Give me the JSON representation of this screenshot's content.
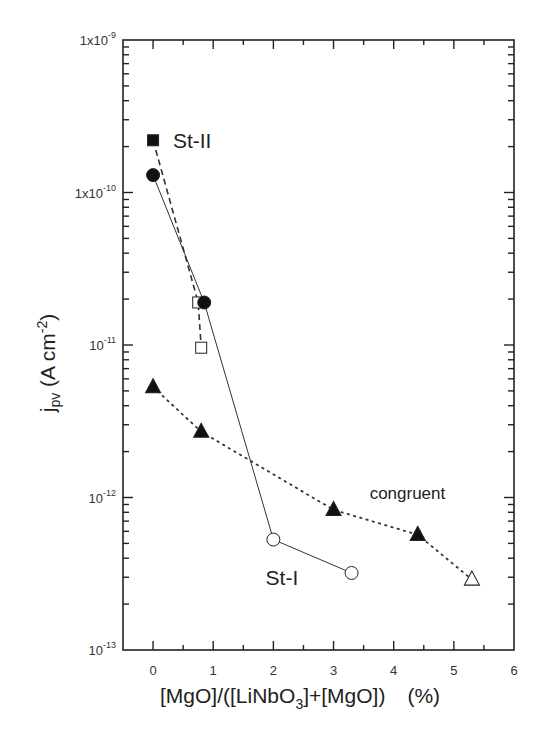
{
  "chart_data": {
    "type": "scatter",
    "title": "",
    "xlabel": "[MgO]/([LiNbO3]+[MgO])    (%)",
    "xlabel_parts": {
      "a": "[MgO]/([LiNbO",
      "sub": "3",
      "b": "]+[MgO])",
      "unit": "(%)"
    },
    "ylabel": "jpv (A cm-2)",
    "ylabel_parts": {
      "main": "j",
      "sub": "pv",
      "unit_open": " (A cm",
      "sup": "-2",
      "unit_close": ")"
    },
    "xlim": [
      -0.5,
      6
    ],
    "ylim": [
      1e-13,
      1e-09
    ],
    "yscale": "log",
    "grid": false,
    "x_ticks": [
      0,
      1,
      2,
      3,
      4,
      5,
      6
    ],
    "x_tick_labels": [
      "0",
      "1",
      "2",
      "3",
      "4",
      "5",
      "6"
    ],
    "y_ticks": [
      {
        "value": 1e-09,
        "base": "1x10",
        "exp": "-9"
      },
      {
        "value": 1e-10,
        "base": "1x10",
        "exp": "-10"
      },
      {
        "value": 1e-11,
        "base": "10",
        "exp": "-11"
      },
      {
        "value": 1e-12,
        "base": "10",
        "exp": "-12"
      },
      {
        "value": 1e-13,
        "base": "10",
        "exp": "-13"
      }
    ],
    "series": [
      {
        "name": "St-II",
        "line": "dashed",
        "points": [
          {
            "x": 0.0,
            "y": 2.2e-10,
            "marker": "square",
            "filled": true
          },
          {
            "x": 0.75,
            "y": 1.9e-11,
            "marker": "square",
            "filled": false
          },
          {
            "x": 0.8,
            "y": 9.6e-12,
            "marker": "square",
            "filled": false
          }
        ]
      },
      {
        "name": "St-I",
        "line": "solid",
        "points": [
          {
            "x": 0.0,
            "y": 1.3e-10,
            "marker": "circle",
            "filled": true
          },
          {
            "x": 0.85,
            "y": 1.9e-11,
            "marker": "circle",
            "filled": true
          },
          {
            "x": 2.0,
            "y": 5.3e-13,
            "marker": "circle",
            "filled": false
          },
          {
            "x": 3.3,
            "y": 3.2e-13,
            "marker": "circle",
            "filled": false
          }
        ]
      },
      {
        "name": "congruent",
        "line": "dotted",
        "points": [
          {
            "x": 0.0,
            "y": 5.3e-12,
            "marker": "triangle",
            "filled": true
          },
          {
            "x": 0.8,
            "y": 2.7e-12,
            "marker": "triangle",
            "filled": true
          },
          {
            "x": 3.0,
            "y": 8.3e-13,
            "marker": "triangle",
            "filled": true
          },
          {
            "x": 4.4,
            "y": 5.7e-13,
            "marker": "triangle",
            "filled": true
          },
          {
            "x": 5.3,
            "y": 2.9e-13,
            "marker": "triangle",
            "filled": false
          }
        ]
      }
    ],
    "annotations": [
      {
        "text": "St-II",
        "near_series": "St-II",
        "anchor_x": 0.33,
        "anchor_y": 2.2e-10
      },
      {
        "text": "congruent",
        "near_series": "congruent",
        "anchor_x": 3.6,
        "anchor_y": 1.1e-12
      },
      {
        "text": "St-I",
        "near_series": "St-I",
        "anchor_x": 1.87,
        "anchor_y": 3e-13
      }
    ]
  }
}
